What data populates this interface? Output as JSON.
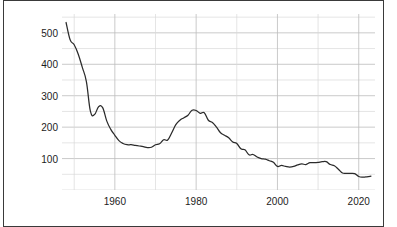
{
  "chart_data": {
    "type": "line",
    "title": "",
    "xlabel": "",
    "ylabel": "Employment in Coal mining (thousands)",
    "xlim": [
      1947,
      1924
    ],
    "x_range": [
      1947,
      2024
    ],
    "ylim": [
      0,
      560
    ],
    "y_axis_max": 560,
    "grid": true,
    "grid_minor_step": 50,
    "legend": "none",
    "line_color": "#2b2b2b",
    "grid_color": "#c9c9c9",
    "axis_text_color": "#1c1c1c",
    "background_color": "#ffffff",
    "yticks": [
      100,
      200,
      300,
      400,
      500
    ],
    "ytick_labels": [
      "100",
      "200",
      "300",
      "400",
      "500"
    ],
    "xticks": [
      1960,
      1980,
      2000,
      2020
    ],
    "xtick_labels": [
      "1960",
      "1980",
      "2000",
      "2020"
    ],
    "series": [
      {
        "name": "Employment in Coal mining (thousands)",
        "x": [
          1948,
          1949,
          1950,
          1951,
          1952,
          1953,
          1954,
          1955,
          1956,
          1957,
          1958,
          1959,
          1960,
          1961,
          1962,
          1963,
          1964,
          1965,
          1966,
          1967,
          1968,
          1969,
          1970,
          1971,
          1972,
          1973,
          1974,
          1975,
          1976,
          1977,
          1978,
          1979,
          1980,
          1981,
          1982,
          1983,
          1984,
          1985,
          1986,
          1987,
          1988,
          1989,
          1990,
          1991,
          1992,
          1993,
          1994,
          1995,
          1996,
          1997,
          1998,
          1999,
          2000,
          2001,
          2002,
          2003,
          2004,
          2005,
          2006,
          2007,
          2008,
          2009,
          2010,
          2011,
          2012,
          2013,
          2014,
          2015,
          2016,
          2017,
          2018,
          2019,
          2020,
          2021,
          2022,
          2023
        ],
        "values": [
          533,
          478,
          462,
          432,
          390,
          345,
          250,
          240,
          265,
          262,
          220,
          193,
          174,
          157,
          148,
          144,
          144,
          142,
          140,
          138,
          135,
          136,
          144,
          147,
          160,
          159,
          182,
          208,
          222,
          230,
          238,
          254,
          253,
          244,
          246,
          222,
          215,
          200,
          182,
          174,
          166,
          153,
          148,
          131,
          128,
          112,
          113,
          105,
          100,
          98,
          93,
          88,
          75,
          78,
          75,
          73,
          75,
          80,
          83,
          81,
          87,
          87,
          88,
          90,
          90,
          81,
          77,
          66,
          54,
          53,
          53,
          52,
          43,
          41,
          42,
          44
        ]
      }
    ],
    "annotations": []
  },
  "axis": {
    "y_label": "Employment in Coal mining (thousands)"
  }
}
